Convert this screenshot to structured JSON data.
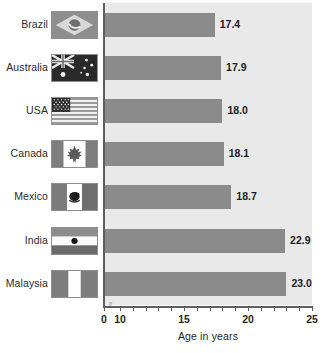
{
  "chart_data": {
    "type": "bar",
    "orientation": "horizontal",
    "title": "",
    "xlabel": "Age in years",
    "ylabel": "",
    "categories": [
      "Brazil",
      "Australia",
      "USA",
      "Canada",
      "Mexico",
      "India",
      "Malaysia"
    ],
    "values": [
      17.4,
      17.9,
      18.0,
      18.1,
      18.7,
      22.9,
      23.0
    ],
    "value_labels": [
      "17.4",
      "17.9",
      "18.0",
      "18.1",
      "18.7",
      "22.9",
      "23.0"
    ],
    "xlim": [
      0,
      25
    ],
    "axis_break": true,
    "axis_break_after": 0,
    "tick_labels": [
      "0",
      "10",
      "15",
      "20",
      "25"
    ],
    "tick_values": [
      0,
      10,
      15,
      20,
      25
    ],
    "minor_tick_step": 1,
    "grid": false,
    "legend": "none",
    "series": [
      {
        "name": "Age in years",
        "values": [
          17.4,
          17.9,
          18.0,
          18.1,
          18.7,
          22.9,
          23.0
        ]
      }
    ]
  },
  "colors": {
    "plot_background": "#e9e9e9",
    "bar": "#8b8b8b",
    "axis": "#5d5d5d",
    "text": "#262626",
    "page_background": "#ffffff"
  },
  "rows": [
    {
      "label": "Brazil",
      "value_label": "17.4",
      "flag_name": "flag-brazil"
    },
    {
      "label": "Australia",
      "value_label": "17.9",
      "flag_name": "flag-australia"
    },
    {
      "label": "USA",
      "value_label": "18.0",
      "flag_name": "flag-usa"
    },
    {
      "label": "Canada",
      "value_label": "18.1",
      "flag_name": "flag-canada"
    },
    {
      "label": "Mexico",
      "value_label": "18.7",
      "flag_name": "flag-mexico"
    },
    {
      "label": "India",
      "value_label": "22.9",
      "flag_name": "flag-india"
    },
    {
      "label": "Malaysia",
      "value_label": "23.0",
      "flag_name": "flag-malaysia"
    }
  ],
  "axis": {
    "title": "Age in years",
    "ticks": [
      {
        "label": "0",
        "value": 0
      },
      {
        "label": "10",
        "value": 10
      },
      {
        "label": "15",
        "value": 15
      },
      {
        "label": "20",
        "value": 20
      },
      {
        "label": "25",
        "value": 25
      }
    ],
    "break_glyph": "//"
  }
}
